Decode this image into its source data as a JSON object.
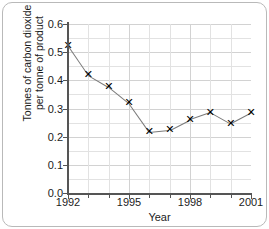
{
  "chart_data": {
    "type": "line",
    "title": "",
    "xlabel": "Year",
    "ylabel": "Tonnes of carbon dioxide per tonne of product",
    "ylabel_line1": "Tonnes of carbon dioxide",
    "ylabel_line2": "per tonne of product",
    "x": [
      1992,
      1993,
      1994,
      1995,
      1996,
      1997,
      1998,
      1999,
      2000,
      2001
    ],
    "values": [
      0.525,
      0.42,
      0.378,
      0.32,
      0.218,
      0.225,
      0.262,
      0.287,
      0.247,
      0.285
    ],
    "xlim": [
      1992,
      2001
    ],
    "ylim": [
      0.0,
      0.6
    ],
    "ytick_labels": [
      "0.0",
      "0.1",
      "0.2",
      "0.3",
      "0.4",
      "0.5",
      "0.6"
    ],
    "ytick_values": [
      0.0,
      0.1,
      0.2,
      0.3,
      0.4,
      0.5,
      0.6
    ],
    "yminor_step": 0.05,
    "xtick_values": [
      1992,
      1993,
      1994,
      1995,
      1996,
      1997,
      1998,
      1999,
      2000,
      2001
    ],
    "xtick_labels": [
      {
        "value": 1992,
        "label": "1992"
      },
      {
        "value": 1995,
        "label": "1995"
      },
      {
        "value": 1998,
        "label": "1998"
      },
      {
        "value": 2001,
        "label": "2001"
      }
    ],
    "grid": true,
    "legend": "none",
    "marker": "x",
    "line_color": "#7a7a7a",
    "marker_color": "#000000",
    "grid_color": "#e2e2e2",
    "axis_color": "#555555"
  }
}
